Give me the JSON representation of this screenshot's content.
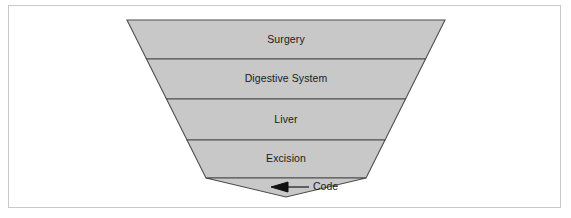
{
  "figure": {
    "type": "inverted-pyramid-diagram",
    "frame_border_color": "#c9c9c9",
    "background_color": "#ffffff",
    "fill_color": "#c8c8c8",
    "stroke_color": "#4d4d4d",
    "text_color": "#1a1a1a"
  },
  "pyramid": {
    "levels": [
      {
        "label": "Surgery",
        "order": 1
      },
      {
        "label": "Digestive System",
        "order": 2
      },
      {
        "label": "Liver",
        "order": 3
      },
      {
        "label": "Excision",
        "order": 4
      }
    ]
  },
  "callout": {
    "label": "Code",
    "points_to": "apex-segment"
  }
}
